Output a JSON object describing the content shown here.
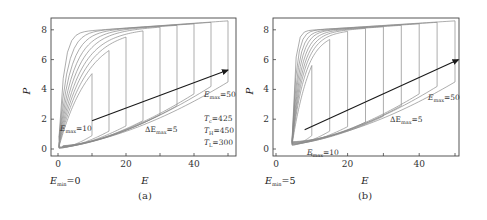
{
  "figure": {
    "panels": [
      {
        "id": "a",
        "caption": "(a)",
        "emin_label": "E",
        "emin_sub": "min",
        "emin_value": "=0",
        "annotations": {
          "emax_low": {
            "sym": "E",
            "sub": "max",
            "val": "=10"
          },
          "emax_high": {
            "sym": "E",
            "sub": "max",
            "val": "=50"
          },
          "delta": {
            "sym": "ΔE",
            "sub": "max",
            "val": "=5"
          },
          "params": [
            {
              "sym": "T",
              "sub": "c",
              "val": "=425"
            },
            {
              "sym": "T",
              "sub": "H",
              "val": "=450"
            },
            {
              "sym": "T",
              "sub": "L",
              "val": "=300"
            }
          ]
        }
      },
      {
        "id": "b",
        "caption": "(b)",
        "emin_label": "E",
        "emin_sub": "min",
        "emin_value": "=5",
        "annotations": {
          "emax_low": {
            "sym": "E",
            "sub": "max",
            "val": "=10"
          },
          "emax_high": {
            "sym": "E",
            "sub": "max",
            "val": "=50"
          },
          "delta": {
            "sym": "ΔE",
            "sub": "max",
            "val": "=5"
          }
        }
      }
    ],
    "axes": {
      "xlabel": "E",
      "ylabel": "P",
      "xticks": [
        "0",
        "20",
        "40"
      ],
      "yticks": [
        "0",
        "2",
        "4",
        "6",
        "8"
      ]
    },
    "colors": {
      "curve": "#8a8a8a",
      "arrow": "#1a1a1a",
      "frame": "#333333"
    }
  },
  "chart_data": [
    {
      "type": "line",
      "panel": "(a)",
      "title": "",
      "xlabel": "E",
      "ylabel": "P",
      "xlim": [
        -1.5,
        52
      ],
      "ylim": [
        -0.4,
        8.7
      ],
      "xticks": [
        0,
        20,
        40
      ],
      "yticks": [
        0,
        2,
        4,
        6,
        8
      ],
      "grid": false,
      "legend": null,
      "description": "Family of P-E hysteresis loops with E_min=0 and E_max from 10 to 50 in steps of 5 (Tc=425, TH=450, TL=300). Arrow indicates increasing E_max.",
      "series": [
        {
          "name": "E_max=10",
          "emax": 10,
          "upper_start": 7.4,
          "upper_end": 7.45,
          "lower_end": 0.9
        },
        {
          "name": "E_max=15",
          "emax": 15,
          "upper_start": 7.6,
          "upper_end": 7.75,
          "lower_end": 1.2
        },
        {
          "name": "E_max=20",
          "emax": 20,
          "upper_start": 7.7,
          "upper_end": 7.95,
          "lower_end": 1.55
        },
        {
          "name": "E_max=25",
          "emax": 25,
          "upper_start": 7.75,
          "upper_end": 8.05,
          "lower_end": 1.9
        },
        {
          "name": "E_max=30",
          "emax": 30,
          "upper_start": 7.8,
          "upper_end": 8.2,
          "lower_end": 2.3
        },
        {
          "name": "E_max=35",
          "emax": 35,
          "upper_start": 7.8,
          "upper_end": 8.3,
          "lower_end": 2.9
        },
        {
          "name": "E_max=40",
          "emax": 40,
          "upper_start": 7.8,
          "upper_end": 8.4,
          "lower_end": 3.7
        },
        {
          "name": "E_max=45",
          "emax": 45,
          "upper_start": 7.8,
          "upper_end": 8.5,
          "lower_end": 4.2
        },
        {
          "name": "E_max=50",
          "emax": 50,
          "upper_start": 7.8,
          "upper_end": 8.6,
          "lower_end": 4.5
        }
      ],
      "arrow": {
        "from": [
          10,
          1.9
        ],
        "to": [
          50,
          5.3
        ]
      },
      "annotations": [
        "E_max=10",
        "E_max=50",
        "ΔE_max=5",
        "T_c=425",
        "T_H=450",
        "T_L=300",
        "E_min=0"
      ]
    },
    {
      "type": "line",
      "panel": "(b)",
      "title": "",
      "xlabel": "E",
      "ylabel": "P",
      "xlim": [
        -1,
        52
      ],
      "ylim": [
        -0.4,
        8.7
      ],
      "xticks": [
        0,
        20,
        40
      ],
      "yticks": [
        0,
        2,
        4,
        6,
        8
      ],
      "grid": false,
      "legend": null,
      "description": "Family of P-E hysteresis loops with E_min=5 and E_max from 10 to 50 in steps of 5. Arrow indicates increasing E_max.",
      "series": [
        {
          "name": "E_max=10",
          "emax": 10,
          "upper_start": 6.5,
          "upper_end": 7.4,
          "lower_end": 0.9
        },
        {
          "name": "E_max=15",
          "emax": 15,
          "upper_start": 7.5,
          "upper_end": 7.75,
          "lower_end": 1.2
        },
        {
          "name": "E_max=20",
          "emax": 20,
          "upper_start": 7.7,
          "upper_end": 7.95,
          "lower_end": 1.5
        },
        {
          "name": "E_max=25",
          "emax": 25,
          "upper_start": 7.75,
          "upper_end": 8.1,
          "lower_end": 1.8
        },
        {
          "name": "E_max=30",
          "emax": 30,
          "upper_start": 7.8,
          "upper_end": 8.2,
          "lower_end": 2.2
        },
        {
          "name": "E_max=35",
          "emax": 35,
          "upper_start": 7.85,
          "upper_end": 8.3,
          "lower_end": 2.9
        },
        {
          "name": "E_max=40",
          "emax": 40,
          "upper_start": 7.85,
          "upper_end": 8.4,
          "lower_end": 3.7
        },
        {
          "name": "E_max=45",
          "emax": 45,
          "upper_start": 7.9,
          "upper_end": 8.5,
          "lower_end": 4.2
        },
        {
          "name": "E_max=50",
          "emax": 50,
          "upper_start": 7.9,
          "upper_end": 8.6,
          "lower_end": 4.5
        }
      ],
      "arrow": {
        "from": [
          8,
          1.3
        ],
        "to": [
          51,
          6.0
        ]
      },
      "annotations": [
        "E_max=10",
        "E_max=50",
        "ΔE_max=5",
        "E_min=5"
      ]
    }
  ]
}
